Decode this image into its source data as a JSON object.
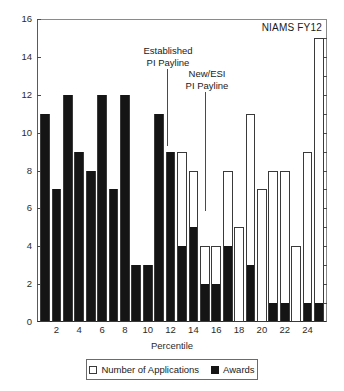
{
  "series_tag": "NIAMS FY12",
  "axes": {
    "ylabel": "",
    "xlabel": "Percentile",
    "yticks": [
      0,
      2,
      4,
      6,
      8,
      10,
      12,
      14,
      16
    ],
    "ytick_labels": [
      "0",
      "2",
      "4",
      "6",
      "8",
      "10",
      "12",
      "14",
      "16"
    ],
    "xticks": [
      2,
      4,
      6,
      8,
      10,
      12,
      14,
      16,
      18,
      20,
      22,
      24
    ],
    "xtick_labels": [
      "2",
      "4",
      "6",
      "8",
      "10",
      "12",
      "14",
      "16",
      "18",
      "20",
      "22",
      "24"
    ],
    "ylim": [
      0,
      16
    ],
    "xlim": [
      0.3,
      25.7
    ]
  },
  "legend": {
    "position": "below-axes",
    "entries": [
      {
        "label": "Number of Applications",
        "swatch": "open-square",
        "color": "#ffffff"
      },
      {
        "label": "Awards",
        "swatch": "filled-square",
        "color": "#151515"
      }
    ]
  },
  "annotations": [
    {
      "name": "established-pi-payline",
      "text": "Established\nPI Payline",
      "x_value": 12.2,
      "text_left": 126,
      "text_top": 45,
      "text_width": 84,
      "line_left": 167,
      "line_top": 69,
      "line_height": 77
    },
    {
      "name": "new-esi-pi-payline",
      "text": "New/ESI\nPI Payline",
      "x_value": 15.4,
      "text_left": 168,
      "text_top": 68,
      "text_width": 78,
      "line_left": 205,
      "line_top": 92,
      "line_height": 119
    }
  ],
  "chart_data": {
    "type": "bar",
    "title": "",
    "subtitle": "",
    "xlabel": "Percentile",
    "ylabel": "",
    "xlim": [
      0.3,
      25.7
    ],
    "ylim": [
      0,
      16
    ],
    "grid": false,
    "legend_position": "below-axes",
    "categories": [
      1,
      2,
      3,
      4,
      5,
      6,
      7,
      8,
      9,
      10,
      11,
      12,
      13,
      14,
      15,
      16,
      17,
      18,
      19,
      20,
      21,
      22,
      23,
      24,
      25
    ],
    "series": [
      {
        "name": "Number of Applications",
        "style": "open-outline",
        "values": [
          11,
          7,
          12,
          9,
          8,
          12,
          7,
          12,
          3,
          3,
          11,
          9,
          9,
          8,
          4,
          4,
          8,
          5,
          11,
          7,
          8,
          8,
          4,
          9,
          15
        ]
      },
      {
        "name": "Awards",
        "style": "filled",
        "values": [
          11,
          7,
          12,
          9,
          8,
          12,
          7,
          12,
          3,
          3,
          11,
          9,
          4,
          5,
          2,
          2,
          4,
          0,
          3,
          0,
          1,
          1,
          0,
          1,
          1
        ]
      }
    ]
  }
}
